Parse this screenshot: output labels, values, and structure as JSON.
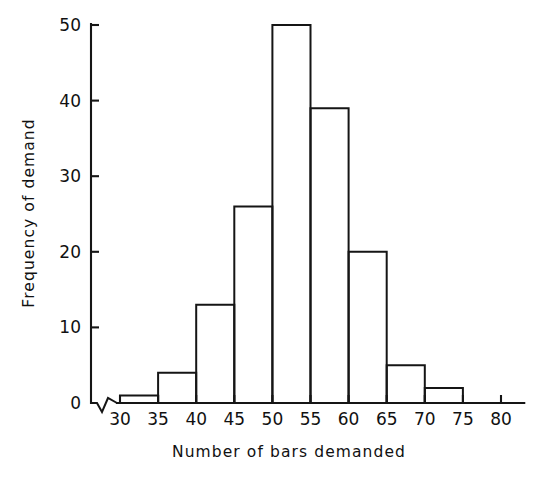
{
  "chart_data": {
    "type": "bar",
    "title": "",
    "subtitle": "",
    "xlabel": "Number of bars demanded",
    "ylabel": "Frequency of demand",
    "categories": [
      "30-35",
      "35-40",
      "40-45",
      "45-50",
      "50-55",
      "55-60",
      "60-65",
      "65-70",
      "70-75",
      "75-80"
    ],
    "bin_edges": [
      30,
      35,
      40,
      45,
      50,
      55,
      60,
      65,
      70,
      75,
      80
    ],
    "values": [
      1,
      4,
      13,
      26,
      50,
      39,
      20,
      5,
      2,
      0
    ],
    "bin_width": 5,
    "xlim": [
      27,
      82
    ],
    "ylim": [
      0,
      50
    ],
    "xticks": [
      30,
      35,
      40,
      45,
      50,
      55,
      60,
      65,
      70,
      75,
      80
    ],
    "yticks": [
      0,
      10,
      20,
      30,
      40,
      50
    ],
    "xtick_labels": [
      "30",
      "35",
      "40",
      "45",
      "50",
      "55",
      "60",
      "65",
      "70",
      "75",
      "80"
    ],
    "ytick_labels": [
      "0",
      "10",
      "20",
      "30",
      "40",
      "50"
    ],
    "grid": false,
    "legend": false,
    "legend_position": "none",
    "axis_break": true,
    "bar_fill": "#ffffff",
    "bar_stroke": "#151515",
    "background": "#ffffff"
  },
  "figure": {
    "xlabel": "Number of bars demanded",
    "ylabel": "Frequency of demand"
  }
}
